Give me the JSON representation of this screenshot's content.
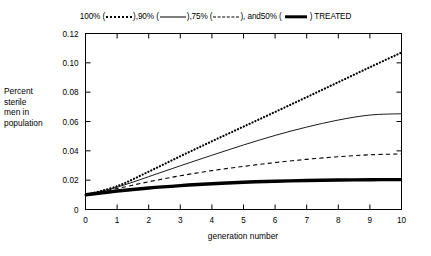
{
  "chart_data": {
    "type": "line",
    "title": "",
    "subtitle": "",
    "xlabel": "generation number",
    "ylabel": "Percent sterile men in population",
    "xlim": [
      0,
      10
    ],
    "ylim": [
      0,
      0.12
    ],
    "xticks": [
      "0",
      "1",
      "2",
      "3",
      "4",
      "5",
      "6",
      "7",
      "8",
      "9",
      "10"
    ],
    "yticks": [
      "0",
      "0.02",
      "0.04",
      "0.06",
      "0.08",
      "0.10",
      "0.12"
    ],
    "grid": false,
    "legend_position": "top",
    "legend_text_prefix": "100% (",
    "x": [
      0,
      1,
      2,
      3,
      4,
      5,
      6,
      7,
      8,
      9,
      10
    ],
    "series": [
      {
        "name": "100%",
        "style": "dotted",
        "legend_label": "100%",
        "values": [
          0.01,
          0.0159,
          0.0258,
          0.0363,
          0.0465,
          0.0565,
          0.0665,
          0.0766,
          0.0868,
          0.097,
          0.107
        ]
      },
      {
        "name": "90%",
        "style": "solid",
        "legend_label": "90%",
        "values": [
          0.01,
          0.0152,
          0.0224,
          0.0298,
          0.037,
          0.044,
          0.0505,
          0.0562,
          0.061,
          0.0644,
          0.0653
        ]
      },
      {
        "name": "75%",
        "style": "dashed",
        "legend_label": "75%",
        "values": [
          0.01,
          0.0143,
          0.0189,
          0.023,
          0.0265,
          0.0294,
          0.032,
          0.0342,
          0.036,
          0.0373,
          0.0379
        ]
      },
      {
        "name": "50%",
        "style": "thick-solid",
        "legend_label": "50%",
        "values": [
          0.01,
          0.0126,
          0.0147,
          0.0163,
          0.0176,
          0.0186,
          0.0193,
          0.0198,
          0.0201,
          0.0203,
          0.0204
        ]
      }
    ]
  },
  "legend": {
    "parts": [
      {
        "label": "100% (",
        "swatch": "dotted",
        "tail": "), "
      },
      {
        "label": "90% (",
        "swatch": "solid",
        "tail": "), "
      },
      {
        "label": "75% (",
        "swatch": "dashed",
        "tail": "), and "
      },
      {
        "label": "50% (",
        "swatch": "thick",
        "tail": ") TREATED"
      }
    ]
  },
  "axes": {
    "y_title_line1": "Percent",
    "y_title_line2": "sterile",
    "y_title_line3": "men in",
    "y_title_line4": "population",
    "x_title": "generation number"
  },
  "colors": {
    "ink": "#000000",
    "background": "#ffffff"
  }
}
